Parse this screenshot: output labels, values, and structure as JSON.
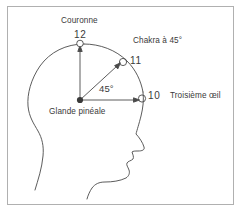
{
  "figure": {
    "line_color": "#4a4a4a",
    "text_color": "#3a3a3a",
    "border_color": "#b0b0b0",
    "background": "#ffffff"
  },
  "labels": {
    "crown": "Couronne",
    "chakra_45": "Chakra à 45°",
    "third_eye": "Troisième œil",
    "pineal_gland": "Glande pinéale",
    "angle": "45°"
  },
  "markers": [
    {
      "id": "marker-12",
      "number": "12",
      "label": "Couronne",
      "type": "open-circle"
    },
    {
      "id": "marker-11",
      "number": "11",
      "label": "Chakra à 45°",
      "type": "open-circle"
    },
    {
      "id": "marker-10",
      "number": "10",
      "label": "Troisième œil",
      "type": "open-circle"
    },
    {
      "id": "marker-pineal",
      "number": "",
      "label": "Glande pinéale",
      "type": "filled-dot"
    }
  ]
}
